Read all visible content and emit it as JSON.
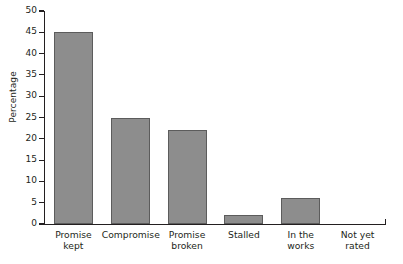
{
  "chart_data": {
    "type": "bar",
    "title": "",
    "subtitle": "",
    "xlabel": "",
    "ylabel": "Percentage",
    "categories": [
      "Promise kept",
      "Compromise",
      "Promise broken",
      "Stalled",
      "In the works",
      "Not yet rated"
    ],
    "category_lines": [
      [
        "Promise",
        "kept"
      ],
      [
        "Compromise"
      ],
      [
        "Promise",
        "broken"
      ],
      [
        "Stalled"
      ],
      [
        "In the",
        "works"
      ],
      [
        "Not yet",
        "rated"
      ]
    ],
    "values": [
      45,
      25,
      22,
      2,
      6,
      0
    ],
    "ylim": [
      0,
      50
    ],
    "ytick_labels": [
      "0",
      "5",
      "10",
      "15",
      "20",
      "25",
      "30",
      "35",
      "40",
      "45",
      "50"
    ],
    "ytick_values": [
      0,
      5,
      10,
      15,
      20,
      25,
      30,
      35,
      40,
      45,
      50
    ],
    "grid": false,
    "legend": null,
    "legend_position": "none",
    "bar_fill_color": "#8d8d8d",
    "bar_edge_color": "#5c5c5c",
    "axis_color": "#231f20",
    "background_color": "#ffffff"
  }
}
